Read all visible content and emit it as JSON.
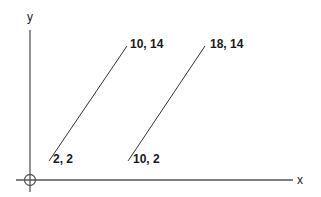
{
  "diagram": {
    "type": "coordinate-plane-line-segments",
    "axes": {
      "x_label": "x",
      "y_label": "y"
    },
    "segments": [
      {
        "start_label": "2, 2",
        "end_label": "10, 14",
        "start": [
          2,
          2
        ],
        "end": [
          10,
          14
        ]
      },
      {
        "start_label": "10, 2",
        "end_label": "18, 14",
        "start": [
          10,
          2
        ],
        "end": [
          18,
          14
        ]
      }
    ],
    "colors": {
      "line": "#333333",
      "axis": "#555555",
      "text": "#1a1a1a",
      "background": "#ffffff"
    }
  }
}
